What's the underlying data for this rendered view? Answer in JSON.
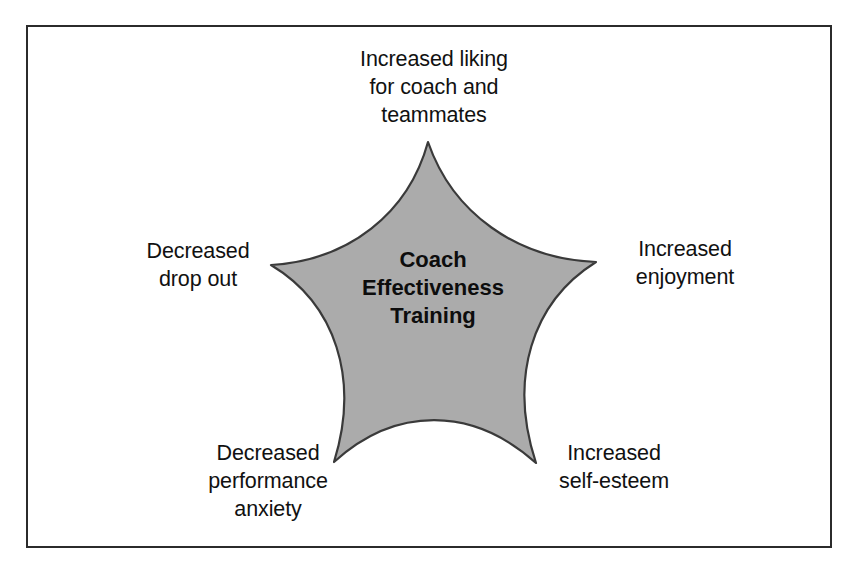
{
  "figure": {
    "type": "concept-diagram",
    "shape": "five-pointed-concave-star",
    "frame_border_color": "#2b2b2b",
    "background_color": "#ffffff"
  },
  "star": {
    "fill_color": "#ababab",
    "stroke_color": "#3a3a3a",
    "center_label": "Coach\nEffectiveness\nTraining",
    "center_x": 433,
    "center_y": 300,
    "points": [
      {
        "name": "top",
        "x": 428,
        "y": 142
      },
      {
        "name": "right",
        "x": 596,
        "y": 262
      },
      {
        "name": "bottom-right",
        "x": 536,
        "y": 463
      },
      {
        "name": "bottom-left",
        "x": 334,
        "y": 462
      },
      {
        "name": "left",
        "x": 271,
        "y": 265
      }
    ]
  },
  "labels": {
    "top": "Increased liking\nfor coach and\nteammates",
    "right": "Increased\nenjoyment",
    "bottom_right": "Increased\nself-esteem",
    "bottom_left": "Decreased\nperformance\nanxiety",
    "left": "Decreased\ndrop out"
  },
  "chart_data": {
    "type": "diagram",
    "title": "Coach Effectiveness Training",
    "center": "Coach Effectiveness Training",
    "categories": [
      "Increased liking for coach and teammates",
      "Increased enjoyment",
      "Increased self-esteem",
      "Decreased performance anxiety",
      "Decreased drop out"
    ],
    "relationship": "outcomes-radiating-from-center",
    "legend": "none",
    "grid": false
  }
}
